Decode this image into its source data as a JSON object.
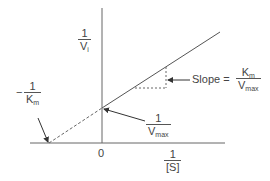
{
  "diagram": {
    "colors": {
      "line": "#555555",
      "text": "#444444",
      "background": "#ffffff"
    },
    "y_axis": {
      "label_num": "1",
      "label_den_main": "V",
      "label_den_sub": "i"
    },
    "x_axis": {
      "label_num": "1",
      "label_den": "[S]",
      "origin_label": "0"
    },
    "x_intercept": {
      "sign": "−",
      "label_num": "1",
      "label_den_main": "K",
      "label_den_sub": "m"
    },
    "y_intercept": {
      "label_num": "1",
      "label_den_main": "V",
      "label_den_sub": "max"
    },
    "slope": {
      "prefix": "Slope =",
      "label_num_main": "K",
      "label_num_sub": "m",
      "label_den_main": "V",
      "label_den_sub": "max"
    }
  }
}
